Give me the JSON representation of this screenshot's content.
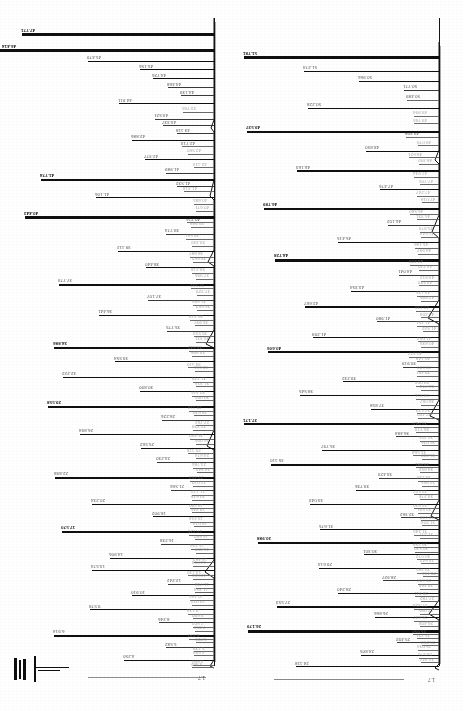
{
  "document": {
    "kind": "scanned-spectrum-printout",
    "title": "Peak-listing spectrum printout",
    "orientation": "rotated-180",
    "panel_count": 2
  },
  "chart_data": [
    {
      "type": "bar",
      "title": "Left panel spectrum",
      "subtitle": "",
      "xlabel": "",
      "ylabel": "",
      "orientation": "horizontal",
      "grid": false,
      "legend": null,
      "axis_side": "right",
      "xlim": [
        0,
        100
      ],
      "ylim": [
        0,
        100
      ],
      "scale_tag": "1.7",
      "baseline_label": "",
      "categories": [
        "47.771",
        "46.414",
        "45.479",
        "45.156",
        "44.726",
        "44.468",
        "44.139",
        "44.011",
        "43.766",
        "43.521",
        "43.337",
        "43.118",
        "42.886",
        "42.713",
        "42.560",
        "42.377",
        "42.113",
        "41.989",
        "41.774",
        "41.532",
        "41.318",
        "41.106",
        "40.885",
        "40.671",
        "40.443",
        "40.216",
        "39.988",
        "39.774",
        "39.551",
        "39.330",
        "39.112",
        "38.887",
        "38.662",
        "38.440",
        "38.218",
        "37.996",
        "37.773",
        "37.551",
        "37.329",
        "37.107",
        "36.885",
        "36.663",
        "36.441",
        "36.219",
        "35.997",
        "35.775",
        "35.553",
        "35.331",
        "34.886",
        "34.442",
        "33.998",
        "33.554",
        "33.110",
        "32.666",
        "32.222",
        "31.778",
        "31.334",
        "30.890",
        "30.446",
        "30.002",
        "29.558",
        "29.114",
        "28.670",
        "28.226",
        "27.782",
        "27.338",
        "26.894",
        "26.450",
        "26.006",
        "25.562",
        "25.118",
        "24.674",
        "24.230",
        "23.786",
        "23.342",
        "22.898",
        "22.454",
        "22.010",
        "21.566",
        "21.122",
        "20.678",
        "20.234",
        "19.790",
        "19.346",
        "18.902",
        "18.458",
        "18.014",
        "17.570",
        "17.126",
        "16.682",
        "16.238",
        "15.794",
        "15.350",
        "14.906",
        "14.462",
        "14.018",
        "13.574",
        "13.130",
        "12.686",
        "12.242",
        "11.798",
        "11.354",
        "10.910",
        "10.466",
        "10.022",
        "9.578",
        "9.134",
        "8.690",
        "8.246",
        "7.802",
        "7.358",
        "6.914",
        "6.470",
        "6.026",
        "5.582",
        "5.138",
        "4.694",
        "4.250",
        "3.806",
        "3.362"
      ],
      "values": [
        96,
        100,
        62,
        40,
        34,
        22,
        18,
        48,
        14,
        30,
        26,
        20,
        44,
        16,
        12,
        36,
        10,
        24,
        82,
        18,
        14,
        66,
        12,
        10,
        98,
        16,
        12,
        28,
        14,
        10,
        54,
        12,
        10,
        38,
        12,
        10,
        74,
        12,
        10,
        32,
        10,
        10,
        58,
        12,
        10,
        26,
        10,
        10,
        88,
        14,
        12,
        46,
        12,
        10,
        70,
        12,
        10,
        34,
        12,
        10,
        92,
        12,
        10,
        24,
        10,
        10,
        64,
        12,
        10,
        42,
        12,
        10,
        30,
        12,
        10,
        78,
        12,
        10,
        20,
        10,
        10,
        56,
        12,
        10,
        36,
        12,
        10,
        86,
        12,
        10,
        28,
        12,
        10,
        50,
        12,
        10,
        68,
        12,
        10,
        22,
        10,
        10,
        40,
        12,
        10,
        60,
        12,
        10,
        32,
        12,
        10,
        76,
        12,
        10,
        26,
        10,
        10,
        44,
        12,
        10
      ]
    },
    {
      "type": "bar",
      "title": "Right panel spectrum",
      "subtitle": "",
      "xlabel": "",
      "ylabel": "",
      "orientation": "horizontal",
      "grid": false,
      "legend": null,
      "axis_side": "right",
      "xlim": [
        0,
        100
      ],
      "ylim": [
        0,
        100
      ],
      "scale_tag": "1.7",
      "baseline_label": "",
      "categories": [
        "51.781",
        "51.274",
        "50.966",
        "50.771",
        "50.489",
        "50.228",
        "49.994",
        "49.766",
        "49.537",
        "49.308",
        "49.079",
        "48.850",
        "48.621",
        "48.392",
        "48.163",
        "47.934",
        "47.705",
        "47.476",
        "47.247",
        "47.018",
        "46.789",
        "46.560",
        "46.331",
        "46.102",
        "45.873",
        "45.644",
        "45.415",
        "45.186",
        "44.957",
        "44.728",
        "44.499",
        "44.270",
        "44.041",
        "43.812",
        "43.583",
        "43.354",
        "43.125",
        "42.896",
        "42.667",
        "42.438",
        "42.209",
        "41.980",
        "41.751",
        "41.522",
        "41.293",
        "41.064",
        "40.835",
        "40.606",
        "40.377",
        "40.148",
        "39.919",
        "39.690",
        "39.461",
        "39.232",
        "39.003",
        "38.774",
        "38.545",
        "38.316",
        "38.087",
        "37.858",
        "37.629",
        "37.400",
        "37.171",
        "36.942",
        "36.713",
        "36.484",
        "36.255",
        "36.026",
        "35.797",
        "35.568",
        "35.339",
        "35.110",
        "34.881",
        "34.652",
        "34.423",
        "34.194",
        "33.965",
        "33.736",
        "33.507",
        "33.278",
        "33.049",
        "32.820",
        "32.591",
        "32.362",
        "32.133",
        "31.904",
        "31.675",
        "31.446",
        "31.217",
        "30.988",
        "30.759",
        "30.530",
        "30.301",
        "30.072",
        "29.843",
        "29.614",
        "29.385",
        "29.156",
        "28.927",
        "28.698",
        "28.469",
        "28.240",
        "28.011",
        "27.782",
        "27.553",
        "27.324",
        "27.095",
        "26.866",
        "26.637",
        "26.408",
        "26.179",
        "25.950",
        "25.721",
        "25.492",
        "25.263",
        "25.034",
        "24.805",
        "24.576",
        "24.347",
        "24.118"
      ],
      "values": [
        100,
        70,
        38,
        20,
        16,
        62,
        14,
        12,
        90,
        16,
        12,
        44,
        14,
        10,
        74,
        12,
        10,
        34,
        12,
        10,
        84,
        14,
        12,
        28,
        10,
        10,
        56,
        12,
        10,
        96,
        14,
        12,
        24,
        10,
        10,
        48,
        12,
        10,
        78,
        12,
        10,
        30,
        12,
        10,
        66,
        12,
        10,
        88,
        14,
        12,
        20,
        10,
        10,
        52,
        12,
        10,
        72,
        12,
        10,
        36,
        12,
        10,
        92,
        14,
        12,
        26,
        10,
        10,
        60,
        12,
        10,
        80,
        12,
        10,
        32,
        12,
        10,
        46,
        12,
        10,
        68,
        12,
        10,
        22,
        10,
        10,
        58,
        12,
        10,
        86,
        14,
        12,
        40,
        12,
        10,
        64,
        12,
        10,
        28,
        10,
        10,
        50,
        12,
        10,
        76,
        12,
        10,
        34,
        12,
        10,
        94,
        14,
        12,
        24,
        10,
        10,
        42,
        12,
        10,
        70
      ]
    }
  ],
  "annotations": {
    "left_scale_tag": "1.7",
    "right_scale_tag": "1.7",
    "integrator_marks": [
      "",
      "",
      ""
    ]
  }
}
